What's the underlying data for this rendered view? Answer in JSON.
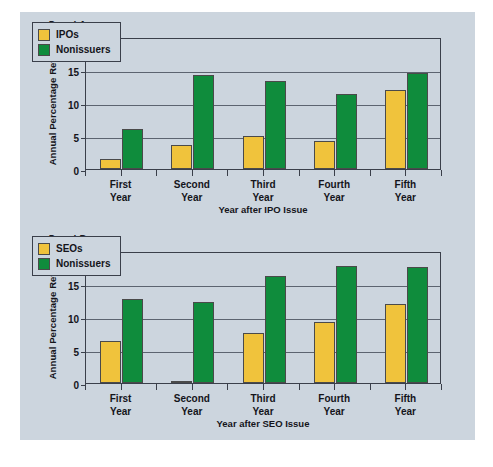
{
  "figure": {
    "background_color": "#ccd5de",
    "issuer_color": "#f0c33c",
    "nonissuer_color": "#0f8c3c"
  },
  "panels": [
    {
      "label": "Panel A",
      "ylabel": "Annual Percentage Return",
      "xlabel": "Year after IPO Issue",
      "yticks": [
        "0",
        "5",
        "10",
        "15",
        "20"
      ],
      "categories": [
        "First\nYear",
        "Second\nYear",
        "Third\nYear",
        "Fourth\nYear",
        "Fifth\nYear"
      ],
      "legend": [
        "IPOs",
        "Nonissuers"
      ]
    },
    {
      "label": "Panel B",
      "ylabel": "Annual Percentage Return",
      "xlabel": "Year after SEO Issue",
      "yticks": [
        "0",
        "5",
        "10",
        "15",
        "20"
      ],
      "categories": [
        "First\nYear",
        "Second\nYear",
        "Third\nYear",
        "Fourth\nYear",
        "Fifth\nYear"
      ],
      "legend": [
        "SEOs",
        "Nonissuers"
      ]
    }
  ],
  "chart_data": [
    {
      "type": "bar",
      "title": "Panel A",
      "categories": [
        "First Year",
        "Second Year",
        "Third Year",
        "Fourth Year",
        "Fifth Year"
      ],
      "series": [
        {
          "name": "IPOs",
          "values": [
            1.5,
            3.7,
            5.0,
            4.2,
            11.9
          ],
          "color": "#f0c33c"
        },
        {
          "name": "Nonissuers",
          "values": [
            6.0,
            14.2,
            13.3,
            11.3,
            14.6
          ],
          "color": "#0f8c3c"
        }
      ],
      "xlabel": "Year after IPO Issue",
      "ylabel": "Annual Percentage Return",
      "ylim": [
        0,
        20
      ],
      "yticks": [
        0,
        5,
        10,
        15,
        20
      ],
      "grid": true,
      "legend_position": "upper-left"
    },
    {
      "type": "bar",
      "title": "Panel B",
      "categories": [
        "First Year",
        "Second Year",
        "Third Year",
        "Fourth Year",
        "Fifth Year"
      ],
      "series": [
        {
          "name": "SEOs",
          "values": [
            6.3,
            0.3,
            7.6,
            9.2,
            12.0
          ],
          "color": "#f0c33c"
        },
        {
          "name": "Nonissuers",
          "values": [
            12.8,
            12.3,
            16.2,
            17.7,
            17.6
          ],
          "color": "#0f8c3c"
        }
      ],
      "xlabel": "Year after SEO Issue",
      "ylabel": "Annual Percentage Return",
      "ylim": [
        0,
        20
      ],
      "yticks": [
        0,
        5,
        10,
        15,
        20
      ],
      "grid": true,
      "legend_position": "upper-left"
    }
  ]
}
